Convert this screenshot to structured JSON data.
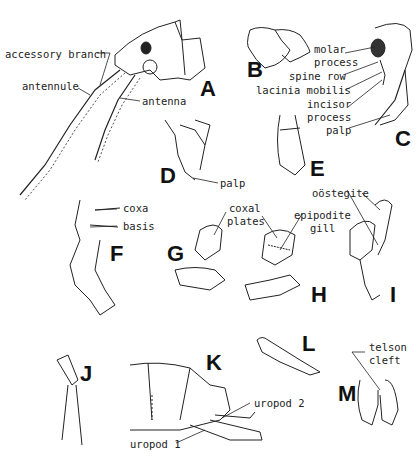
{
  "figure": {
    "panels": [
      "A",
      "B",
      "C",
      "D",
      "E",
      "F",
      "G",
      "H",
      "I",
      "J",
      "K",
      "L",
      "M"
    ],
    "labels": {
      "accessory_branch": "accessory branch",
      "antennule": "antennule",
      "antenna": "antenna",
      "molar_process": [
        "molar",
        "process"
      ],
      "spine_row": "spine row",
      "lacinia_mobilis": "lacinia mobilis",
      "incisor_process": [
        "incisor",
        "process"
      ],
      "palp_c": "palp",
      "palp_d": "palp",
      "coxa": "coxa",
      "basis": "basis",
      "coxal_plates": [
        "coxal",
        "plates"
      ],
      "epipodite_gill": [
        "epipodite",
        "gill"
      ],
      "oostegite": "oöstegite",
      "uropod_2": "uropod 2",
      "uropod_1": "uropod 1",
      "telson_cleft": [
        "telson",
        "cleft"
      ]
    }
  }
}
